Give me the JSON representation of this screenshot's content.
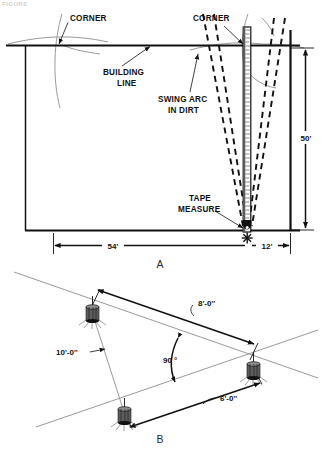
{
  "page": {
    "top_crumb": "FIGURE",
    "width": 321,
    "height": 450,
    "background": "#ffffff",
    "ink": "#111111",
    "string_line_color": "#9a9a9a"
  },
  "figure_a": {
    "caption": "A",
    "labels": {
      "corner_left": "CORNER",
      "corner_right": "CORNER",
      "building_line": "BUILDING\nLINE",
      "building_line_1": "BUILDING",
      "building_line_2": "LINE",
      "swing_arc": "SWING ARC\nIN DIRT",
      "swing_arc_1": "SWING ARC",
      "swing_arc_2": "IN DIRT",
      "tape_measure": "TAPE\nMEASURE",
      "tape_measure_1": "TAPE",
      "tape_measure_2": "MEASURE"
    },
    "dimensions": {
      "vertical_right": "50'",
      "horizontal_left": "54'",
      "horizontal_right": "12'"
    }
  },
  "figure_b": {
    "caption": "B",
    "dimensions": {
      "hypotenuse": "10'-0''",
      "long_leg": "8'-0''",
      "short_leg": "6'-0''",
      "angle": "90 °"
    },
    "stake_count": 3
  }
}
